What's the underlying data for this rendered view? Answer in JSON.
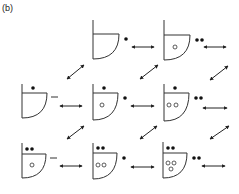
{
  "figure": {
    "label": "(b)",
    "stroke_color": "#333333",
    "background": "#ffffff"
  },
  "states": [
    {
      "id": "r0c1",
      "x": 93,
      "y_top": 20,
      "y_bar": 34,
      "y_bot": 59,
      "w": 26,
      "filled_top": 0,
      "open": [],
      "side_dots": 1,
      "side_dash": false
    },
    {
      "id": "r0c2",
      "x": 164,
      "y_top": 20,
      "y_bar": 35,
      "y_bot": 60,
      "w": 26,
      "filled_top": 0,
      "open": [
        [
          175,
          47
        ]
      ],
      "side_dots": 2,
      "side_dash": false
    },
    {
      "id": "r1c0",
      "x": 22,
      "y_top": 84,
      "y_bar": 93,
      "y_bot": 118,
      "w": 25,
      "filled_top": 1,
      "open": [],
      "side_dots": 0,
      "side_dash": true
    },
    {
      "id": "r1c1",
      "x": 93,
      "y_top": 84,
      "y_bar": 93,
      "y_bot": 120,
      "w": 25,
      "filled_top": 1,
      "open": [
        [
          102,
          105
        ]
      ],
      "side_dots": 1,
      "side_dash": false
    },
    {
      "id": "r1c2",
      "x": 164,
      "y_top": 84,
      "y_bar": 93,
      "y_bot": 121,
      "w": 25,
      "filled_top": 1,
      "open": [
        [
          169,
          105
        ],
        [
          176,
          105
        ]
      ],
      "side_dots": 2,
      "side_dash": false
    },
    {
      "id": "r2c0",
      "x": 22,
      "y_top": 143,
      "y_bar": 154,
      "y_bot": 178,
      "w": 24,
      "filled_top": 2,
      "open": [
        [
          32,
          165
        ]
      ],
      "side_dots": 0,
      "side_dash": true
    },
    {
      "id": "r2c1",
      "x": 93,
      "y_top": 143,
      "y_bar": 153,
      "y_bot": 179,
      "w": 24,
      "filled_top": 2,
      "open": [
        [
          98,
          165
        ],
        [
          104,
          165
        ]
      ],
      "side_dots": 1,
      "side_dash": false
    },
    {
      "id": "r2c2",
      "x": 163,
      "y_top": 142,
      "y_bar": 153,
      "y_bot": 178,
      "w": 24,
      "filled_top": 2,
      "open": [
        [
          168,
          163
        ],
        [
          174,
          163
        ],
        [
          171,
          169
        ]
      ],
      "side_dots": 2,
      "side_dash": false
    }
  ],
  "horizontal_arrows": [
    [
      132,
      47,
      154,
      47
    ],
    [
      204,
      47,
      226,
      47
    ],
    [
      60,
      106,
      82,
      106
    ],
    [
      131,
      106,
      154,
      106
    ],
    [
      203,
      108,
      227,
      108
    ],
    [
      60,
      166,
      82,
      166
    ],
    [
      131,
      167,
      154,
      167
    ],
    [
      202,
      166,
      225,
      166
    ]
  ],
  "diagonal_arrows": [
    [
      67,
      79,
      84,
      65
    ],
    [
      140,
      79,
      158,
      65
    ],
    [
      210,
      80,
      228,
      66
    ],
    [
      67,
      139,
      84,
      126
    ],
    [
      140,
      139,
      157,
      126
    ],
    [
      210,
      139,
      229,
      126
    ]
  ]
}
